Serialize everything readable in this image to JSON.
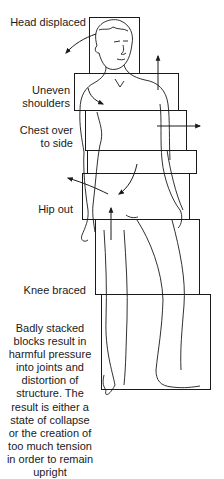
{
  "diagram": {
    "labels": [
      {
        "id": "head",
        "text": "Head displaced"
      },
      {
        "id": "shoulders_line1",
        "text": "Uneven"
      },
      {
        "id": "shoulders_line2",
        "text": "shoulders"
      },
      {
        "id": "chest_line1",
        "text": "Chest over"
      },
      {
        "id": "chest_line2",
        "text": "to side"
      },
      {
        "id": "hip",
        "text": "Hip out"
      },
      {
        "id": "knee",
        "text": "Knee braced"
      }
    ],
    "caption_lines": [
      "Badly stacked",
      "blocks result in",
      "harmful pressure",
      "into joints and",
      "distortion of",
      "structure. The",
      "result is either a",
      "state of collapse",
      "or the creation of",
      "too much tension",
      "in order to remain",
      "upright"
    ],
    "blocks": [
      {
        "name": "head-block",
        "x": 89,
        "y": 17,
        "w": 50,
        "h": 56
      },
      {
        "name": "shoulder-block",
        "x": 74,
        "y": 73,
        "w": 104,
        "h": 37
      },
      {
        "name": "chest-block",
        "x": 85,
        "y": 110,
        "w": 101,
        "h": 40
      },
      {
        "name": "waist-block",
        "x": 87,
        "y": 150,
        "w": 109,
        "h": 23
      },
      {
        "name": "hip-block",
        "x": 82,
        "y": 173,
        "w": 107,
        "h": 46
      },
      {
        "name": "thigh-block",
        "x": 95,
        "y": 219,
        "w": 104,
        "h": 75
      },
      {
        "name": "lower-leg-block",
        "x": 101,
        "y": 294,
        "w": 109,
        "h": 95
      }
    ],
    "colors": {
      "line": "#1a1a1a",
      "background": "#ffffff"
    }
  }
}
